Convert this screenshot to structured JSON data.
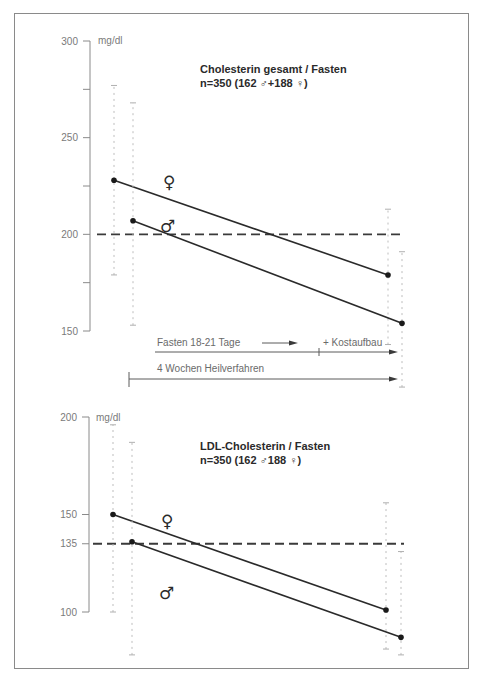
{
  "chart_data": [
    {
      "type": "line",
      "title": "Cholesterin gesamt / Fasten",
      "subtitle": "n=350 (162 ♂+188 ♀)",
      "ylabel": "mg/dl",
      "ylim": [
        150,
        300
      ],
      "yticks": [
        150,
        175,
        200,
        225,
        250,
        275,
        300
      ],
      "ytick_labels": [
        "150",
        "",
        "200",
        "",
        "250",
        "",
        "300"
      ],
      "reference_line": 200,
      "series": [
        {
          "name": "♀",
          "start": 228,
          "end": 179,
          "start_range": [
            179,
            277
          ],
          "end_range": [
            143,
            213
          ]
        },
        {
          "name": "♂",
          "start": 207,
          "end": 154,
          "start_range": [
            153,
            268
          ],
          "end_range": [
            121,
            191
          ]
        }
      ],
      "annotations": {
        "fasting": "Fasten 18-21 Tage",
        "diet": "+ Kostaufbau",
        "cure": "4 Wochen Heilverfahren"
      }
    },
    {
      "type": "line",
      "title": "LDL-Cholesterin / Fasten",
      "subtitle": "n=350 (162 ♂188  ♀)",
      "ylabel": "mg/dl",
      "ylim": [
        100,
        200
      ],
      "yticks": [
        100,
        135,
        150,
        200
      ],
      "ytick_labels": [
        "100",
        "135",
        "150",
        "200"
      ],
      "reference_line": 135,
      "series": [
        {
          "name": "♀",
          "start": 150,
          "end": 101,
          "start_range": [
            100,
            196
          ],
          "end_range": [
            81,
            156
          ]
        },
        {
          "name": "♂",
          "start": 136,
          "end": 87,
          "start_range": [
            78,
            187
          ],
          "end_range": [
            78,
            131
          ]
        }
      ]
    }
  ]
}
